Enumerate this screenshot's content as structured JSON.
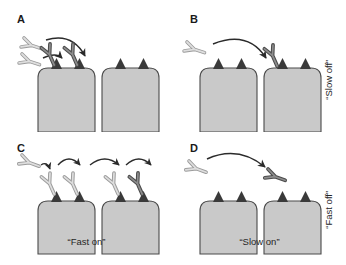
{
  "figure": {
    "background_color": "#ffffff",
    "width": 346,
    "height": 265
  },
  "colors": {
    "cell_fill": "#c9c9c9",
    "cell_stroke": "#4a4a4a",
    "receptor_dark": "#3a3a3a",
    "antibody_free": "#d4d4d4",
    "antibody_free_stroke": "#8a8a8a",
    "antibody_bound": "#6e6e6e",
    "antibody_bound_stroke": "#4a4a4a",
    "arrow": "#2b2b2b",
    "text": "#262626",
    "panel_letter": "#1a1a1a"
  },
  "panels": [
    {
      "id": "A",
      "letter": "A",
      "description": "Two free antibodies approach and bind receptors on the left cell; two arrows curve down to the cell surface",
      "free_antibody_count": 2,
      "bound_antibody_count": 2,
      "cells": 2,
      "receptors_per_cell": 2,
      "arrows": 2,
      "caption": ""
    },
    {
      "id": "B",
      "letter": "B",
      "description": "A single free antibody arcs across and binds a receptor on the right cell",
      "free_antibody_count": 1,
      "bound_antibody_count": 1,
      "cells": 2,
      "receptors_per_cell": 2,
      "arrows": 1,
      "caption": ""
    },
    {
      "id": "C",
      "letter": "C",
      "description": "An antibody hops successively across four receptors left to right, shown with four short arcs",
      "free_antibody_count": 1,
      "bound_antibody_count": 4,
      "cells": 2,
      "receptors_per_cell": 2,
      "arrows": 4,
      "caption": "“Fast on”"
    },
    {
      "id": "D",
      "letter": "D",
      "description": "An antibody departs from the cell surface region, arcing away to the right; no receptors are occupied",
      "free_antibody_count": 1,
      "bound_antibody_count": 0,
      "departing_antibody_count": 1,
      "cells": 2,
      "receptors_per_cell": 2,
      "arrows": 1,
      "caption": "“Slow on”"
    }
  ],
  "captions": {
    "bottom_left": "“Fast on”",
    "bottom_right": "“Slow on”",
    "side_top": "“Slow off”",
    "side_bottom": "“Fast off”"
  }
}
